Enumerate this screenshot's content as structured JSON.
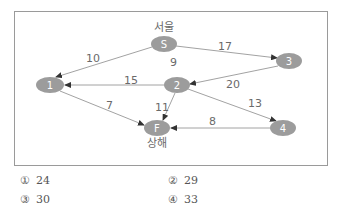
{
  "diagram": {
    "frame": {
      "x": 14,
      "y": 11,
      "width": 314,
      "height": 155,
      "stroke": "#9a9a9a"
    },
    "node_fill": "#9c9c9c",
    "edge_color": "#8a8a8a",
    "nodes": [
      {
        "id": "S",
        "label": "S",
        "city": "서울",
        "cx": 164,
        "cy": 44
      },
      {
        "id": "3",
        "label": "3",
        "cx": 289,
        "cy": 61
      },
      {
        "id": "1",
        "label": "1",
        "cx": 50,
        "cy": 85
      },
      {
        "id": "2",
        "label": "2",
        "cx": 177,
        "cy": 85
      },
      {
        "id": "F",
        "label": "F",
        "city": "상해",
        "cx": 157,
        "cy": 128
      },
      {
        "id": "4",
        "label": "4",
        "cx": 283,
        "cy": 128
      }
    ],
    "edges": [
      {
        "from": "S",
        "to": "1",
        "weight": "10"
      },
      {
        "from": "S",
        "to": "3",
        "weight": "17"
      },
      {
        "from": "3",
        "to": "2",
        "weight": "20"
      },
      {
        "from": "2",
        "to": "1",
        "weight": "15"
      },
      {
        "from": "2",
        "to": "F",
        "weight": "11"
      },
      {
        "from": "2",
        "to": "4",
        "weight": "13"
      },
      {
        "from": "4",
        "to": "F",
        "weight": "8"
      },
      {
        "from": "1",
        "to": "F",
        "weight": "7"
      }
    ],
    "extra_labels": [
      {
        "text": "9"
      }
    ],
    "cities": {
      "S": "서울",
      "F": "상해"
    }
  },
  "options": [
    {
      "mark": "①",
      "value": "24"
    },
    {
      "mark": "②",
      "value": "29"
    },
    {
      "mark": "③",
      "value": "30"
    },
    {
      "mark": "④",
      "value": "33"
    }
  ]
}
